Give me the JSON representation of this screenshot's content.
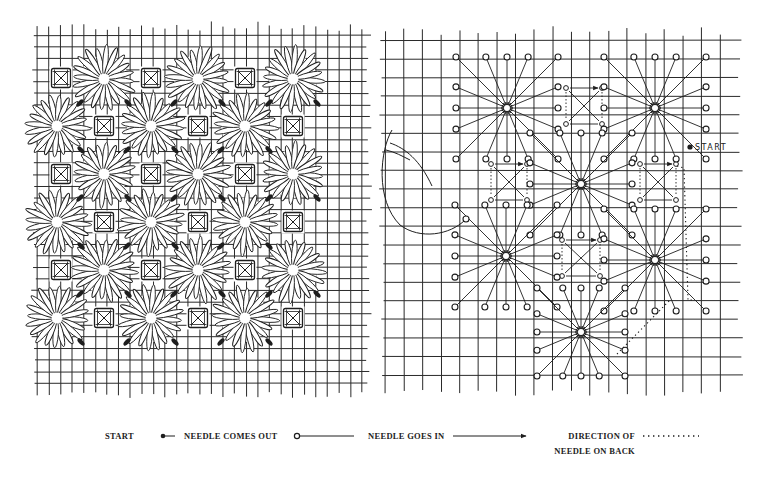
{
  "colors": {
    "ink": "#1e1e1e",
    "paper": "#ffffff",
    "grid": "#2a2a2a"
  },
  "left_panel": {
    "title": "finished-pattern",
    "grid": {
      "x0": 37,
      "x1": 366,
      "y0": 35,
      "y1": 392,
      "step": 11.6
    },
    "flowers": [
      [
        104,
        79
      ],
      [
        198,
        79
      ],
      [
        293,
        79
      ],
      [
        57,
        126
      ],
      [
        151,
        126
      ],
      [
        245,
        126
      ],
      [
        104,
        174
      ],
      [
        198,
        174
      ],
      [
        293,
        174
      ],
      [
        57,
        222
      ],
      [
        151,
        222
      ],
      [
        245,
        222
      ],
      [
        104,
        270
      ],
      [
        198,
        270
      ],
      [
        293,
        270
      ],
      [
        57,
        318
      ],
      [
        151,
        318
      ],
      [
        245,
        318
      ]
    ],
    "squares": [
      [
        61,
        78
      ],
      [
        151,
        78
      ],
      [
        245,
        78
      ],
      [
        104,
        126
      ],
      [
        198,
        126
      ],
      [
        293,
        126
      ],
      [
        61,
        174
      ],
      [
        151,
        174
      ],
      [
        245,
        174
      ],
      [
        104,
        222
      ],
      [
        198,
        222
      ],
      [
        293,
        222
      ],
      [
        61,
        270
      ],
      [
        151,
        270
      ],
      [
        245,
        270
      ],
      [
        104,
        318
      ],
      [
        198,
        318
      ],
      [
        293,
        318
      ]
    ],
    "flower_radius": 30,
    "petal_count": 20
  },
  "right_panel": {
    "title": "stitch-diagram",
    "grid": {
      "x0": 385,
      "x1": 737,
      "y0": 40,
      "y1": 390,
      "step": 18.6
    },
    "stars": [
      {
        "cx": 507,
        "cy": 108,
        "r": 58
      },
      {
        "cx": 655,
        "cy": 108,
        "r": 58
      },
      {
        "cx": 581,
        "cy": 184,
        "r": 58
      },
      {
        "cx": 506,
        "cy": 256,
        "r": 58
      },
      {
        "cx": 655,
        "cy": 260,
        "r": 58
      },
      {
        "cx": 581,
        "cy": 332,
        "r": 50
      }
    ],
    "boxes": [
      {
        "x": 566,
        "y": 88,
        "w": 36,
        "h": 36
      },
      {
        "x": 491,
        "y": 164,
        "w": 36,
        "h": 36
      },
      {
        "x": 640,
        "y": 164,
        "w": 36,
        "h": 36
      },
      {
        "x": 562,
        "y": 240,
        "w": 38,
        "h": 36
      }
    ],
    "start_point": {
      "x": 690,
      "y": 147,
      "label": "START"
    },
    "back_path": [
      [
        677,
        166
      ],
      [
        684,
        168
      ],
      [
        688,
        300
      ],
      [
        692,
        300
      ]
    ],
    "back_path_2": [
      [
        617,
        354
      ],
      [
        670,
        300
      ]
    ]
  },
  "legend": {
    "start": "START",
    "needle_out": "NEEDLE COMES OUT",
    "needle_in": "NEEDLE GOES IN",
    "direction_line1": "DIRECTION OF",
    "direction_line2": "NEEDLE ON BACK"
  }
}
